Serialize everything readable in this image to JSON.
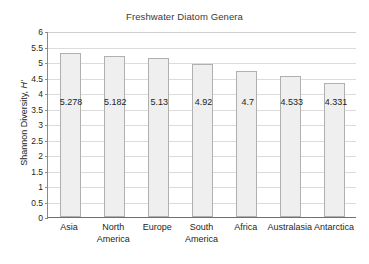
{
  "chart_data": {
    "type": "bar",
    "title": "Freshwater Diatom Genera",
    "xlabel": "",
    "ylabel": "Shannon Diversity, H'",
    "ylabel_text": "Shannon Diversity, ",
    "ylabel_symbol": "H'",
    "categories": [
      "Asia",
      "North America",
      "Europe",
      "South America",
      "Africa",
      "Australasia",
      "Antarctica"
    ],
    "values": [
      5.278,
      5.182,
      5.13,
      4.92,
      4.7,
      4.533,
      4.331
    ],
    "value_labels": [
      "5.278",
      "5.182",
      "5.13",
      "4.92",
      "4.7",
      "4.533",
      "4.331"
    ],
    "ylim": [
      0,
      6
    ],
    "ytick_labels": [
      "6",
      "5.5",
      "5",
      "4.5",
      "4",
      "3.5",
      "3",
      "2.5",
      "2",
      "1.5",
      "1",
      "0.5",
      "0"
    ],
    "ytick_values": [
      6,
      5.5,
      5,
      4.5,
      4,
      3.5,
      3,
      2.5,
      2,
      1.5,
      1,
      0.5,
      0
    ],
    "grid": true,
    "legend": "none",
    "value_label_y": 3.75,
    "colors": {
      "bar_fill": "#efefef",
      "bar_border": "#b0b0b0",
      "gridline": "#dcdcdc",
      "axis": "#6f6f6f",
      "text": "#231f20",
      "title": "#3a3a3a",
      "background": "#ffffff"
    }
  }
}
